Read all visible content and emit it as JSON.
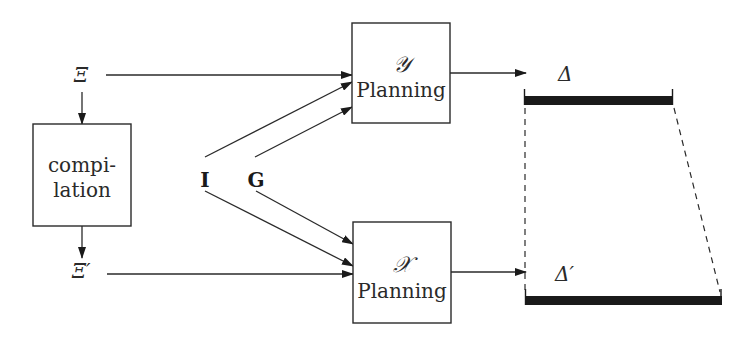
{
  "diagram": {
    "inputs": {
      "xi": "Ξ",
      "xi_prime": "Ξ′",
      "I": "I",
      "G": "G"
    },
    "compilation_box": {
      "line1": "compi-",
      "line2": "lation"
    },
    "y_planning_box": {
      "symbol": "𝒴",
      "label": "Planning"
    },
    "x_planning_box": {
      "symbol": "𝒳",
      "label": "Planning"
    },
    "outputs": {
      "delta": "Δ",
      "delta_prime": "Δ′"
    },
    "colors": {
      "stroke": "#2a2a2a",
      "bar": "#1a1a1a",
      "background": "#ffffff"
    }
  }
}
